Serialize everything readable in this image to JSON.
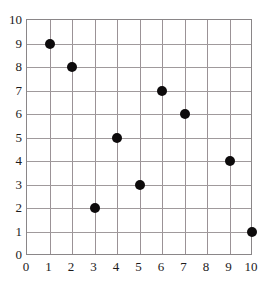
{
  "chart_data": {
    "type": "scatter",
    "title": "",
    "xlabel": "",
    "ylabel": "",
    "xlim": [
      0,
      10
    ],
    "ylim": [
      0,
      10
    ],
    "grid": true,
    "legend": "none",
    "marker": {
      "shape": "circle",
      "color": "#0d0b0c",
      "size_px": 10
    },
    "xticks": [
      "0",
      "1",
      "2",
      "3",
      "4",
      "5",
      "6",
      "7",
      "8",
      "9",
      "10"
    ],
    "yticks": [
      "0",
      "1",
      "2",
      "3",
      "4",
      "5",
      "6",
      "7",
      "8",
      "9",
      "10"
    ],
    "x": [
      1,
      2,
      3,
      4,
      5,
      6,
      7,
      9,
      10
    ],
    "y": [
      9,
      8,
      2,
      5,
      3,
      7,
      6,
      4,
      1
    ],
    "points": [
      {
        "x": 1,
        "y": 9
      },
      {
        "x": 2,
        "y": 8
      },
      {
        "x": 3,
        "y": 2
      },
      {
        "x": 4,
        "y": 5
      },
      {
        "x": 5,
        "y": 3
      },
      {
        "x": 6,
        "y": 7
      },
      {
        "x": 7,
        "y": 6
      },
      {
        "x": 9,
        "y": 4
      },
      {
        "x": 10,
        "y": 1
      }
    ]
  },
  "colors": {
    "background": "#ffffff",
    "gridline": "#9b9296",
    "frame": "#8a8688",
    "marker": "#0d0b0c",
    "tick_text": "#1c1a1b"
  }
}
